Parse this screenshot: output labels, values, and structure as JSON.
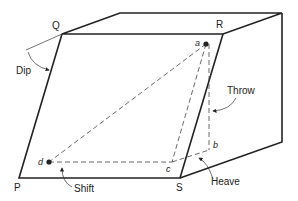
{
  "figure": {
    "corners": {
      "P": "P",
      "Q": "Q",
      "R": "R",
      "S": "S"
    },
    "points": {
      "a": "a",
      "b": "b",
      "c": "c",
      "d": "d"
    },
    "annotations": {
      "dip": "Dip",
      "throw": "Throw",
      "heave": "Heave",
      "shift": "Shift"
    }
  }
}
